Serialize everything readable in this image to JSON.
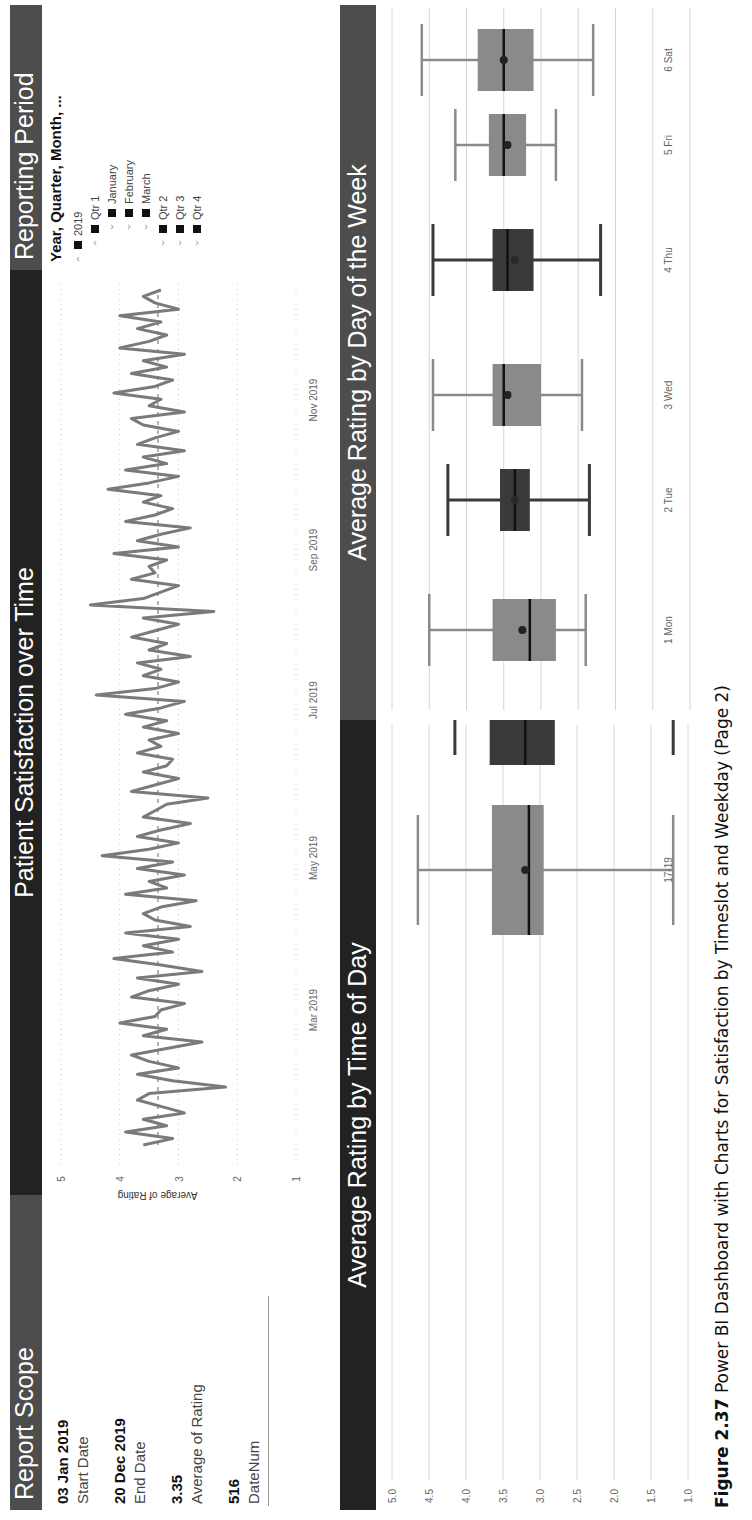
{
  "header_bars": {
    "report_scope": "Report Scope",
    "patient_satisfaction": "Patient Satisfaction over Time",
    "reporting_period": "Reporting Period",
    "time_of_day": "Average Rating by Time of Day",
    "day_of_week": "Average Rating by Day of the Week"
  },
  "report_scope": {
    "cards": [
      {
        "value": "03 Jan 2019",
        "label": "Start Date"
      },
      {
        "value": "20 Dec 2019",
        "label": "End Date"
      },
      {
        "value": "3.35",
        "label": "Average of Rating"
      },
      {
        "value": "516",
        "label": "DateNum"
      }
    ]
  },
  "reporting_period": {
    "title": "Year, Quarter, Month, ...",
    "items": [
      {
        "chevron": "up",
        "checked": true,
        "label": "2019",
        "level": 0
      },
      {
        "chevron": "up",
        "checked": true,
        "label": "Qtr 1",
        "level": 1
      },
      {
        "chevron": "down",
        "checked": true,
        "label": "January",
        "level": 2
      },
      {
        "chevron": "down",
        "checked": true,
        "label": "February",
        "level": 2
      },
      {
        "chevron": "down",
        "checked": true,
        "label": "March",
        "level": 2
      },
      {
        "chevron": "down",
        "checked": true,
        "label": "Qtr 2",
        "level": 1
      },
      {
        "chevron": "down",
        "checked": true,
        "label": "Qtr 3",
        "level": 1
      },
      {
        "chevron": "down",
        "checked": true,
        "label": "Qtr 4",
        "level": 1
      }
    ]
  },
  "caption": {
    "figure": "Figure 2.37",
    "text": "Power BI Dashboard with Charts for Satisfaction by Timeslot and Weekday (Page 2)"
  },
  "colors": {
    "dark_bar": "#222222",
    "mid_bar": "#4d4d4d",
    "line": "#7a7a7a",
    "box_light": "#8a8a8a",
    "box_dark": "#3a3a3a",
    "whisker_light": "#8a8a8a",
    "whisker_dark": "#3a3a3a"
  },
  "chart_data": [
    {
      "type": "line",
      "title": "Patient Satisfaction over Time",
      "xlabel": "",
      "ylabel": "Average of Rating",
      "ylim": [
        1,
        5
      ],
      "yticks": [
        "1",
        "2",
        "3",
        "4",
        "5"
      ],
      "xticks": [
        "Mar 2019",
        "May 2019",
        "Jul 2019",
        "Sep 2019",
        "Nov 2019"
      ],
      "x_range": [
        "03 Jan 2019",
        "20 Dec 2019"
      ],
      "reference_line": {
        "label": "Average",
        "value": 3.35,
        "style": "dashed"
      },
      "grid": true,
      "series": [
        {
          "name": "Average of Rating",
          "values": [
            3.6,
            3.1,
            3.9,
            3.2,
            3.6,
            2.9,
            3.3,
            3.7,
            3.5,
            2.2,
            3.1,
            3.7,
            3.0,
            3.5,
            3.8,
            3.2,
            2.6,
            3.6,
            3.2,
            4.0,
            3.4,
            3.3,
            2.9,
            3.8,
            3.5,
            3.0,
            3.7,
            2.6,
            3.3,
            4.1,
            3.1,
            3.6,
            3.0,
            3.9,
            2.8,
            3.4,
            3.6,
            3.3,
            2.7,
            3.9,
            3.2,
            3.5,
            2.9,
            3.7,
            3.1,
            4.3,
            3.5,
            3.0,
            3.7,
            3.3,
            2.8,
            3.6,
            3.4,
            3.2,
            2.5,
            3.8,
            3.4,
            3.0,
            3.6,
            3.2,
            3.1,
            3.7,
            3.3,
            3.5,
            3.0,
            3.6,
            3.2,
            3.9,
            3.3,
            2.9,
            4.4,
            3.4,
            3.0,
            3.6,
            3.3,
            3.7,
            2.8,
            3.5,
            3.2,
            3.8,
            3.4,
            3.0,
            3.6,
            2.4,
            4.5,
            3.6,
            3.3,
            3.0,
            3.8,
            3.4,
            3.5,
            3.2,
            4.1,
            3.0,
            3.7,
            3.3,
            2.8,
            3.9,
            3.4,
            3.1,
            3.6,
            3.3,
            4.2,
            3.5,
            3.0,
            3.9,
            3.2,
            3.6,
            2.9,
            3.7,
            3.4,
            3.0,
            3.6,
            3.8,
            2.9,
            3.5,
            3.3,
            4.1,
            3.4,
            3.1,
            3.8,
            3.2,
            3.6,
            2.9,
            4.0,
            3.5,
            3.2,
            3.7,
            3.3,
            4.0,
            3.0,
            3.4,
            3.6,
            3.3
          ]
        }
      ]
    },
    {
      "type": "box",
      "title": "Average Rating by Time of Day",
      "categories": [
        "09-11",
        "11-13",
        "13-15",
        "15-17",
        "17-19"
      ],
      "ylim": [
        1.0,
        5.0
      ],
      "yticks": [
        "1.0",
        "1.5",
        "2.0",
        "2.5",
        "3.0",
        "3.5",
        "4.0",
        "4.5",
        "5.0"
      ],
      "grid": true,
      "series": [
        {
          "name": "min",
          "values": [
            2.15,
            2.15,
            2.3,
            1.2,
            1.2
          ]
        },
        {
          "name": "q1",
          "values": [
            2.9,
            2.95,
            3.0,
            2.8,
            2.95
          ]
        },
        {
          "name": "median",
          "values": [
            3.5,
            3.46,
            3.5,
            3.2,
            3.15
          ]
        },
        {
          "name": "mean",
          "values": [
            3.45,
            3.4,
            3.45,
            3.2,
            3.2
          ]
        },
        {
          "name": "q3",
          "values": [
            3.9,
            3.72,
            3.7,
            3.68,
            3.65
          ]
        },
        {
          "name": "max",
          "values": [
            4.5,
            4.6,
            4.55,
            4.15,
            4.65
          ]
        }
      ],
      "shades": [
        "light",
        "dark",
        "light",
        "dark",
        "light"
      ]
    },
    {
      "type": "box",
      "title": "Average Rating by Day of the Week",
      "categories": [
        "1 Mon",
        "2 Tue",
        "3 Wed",
        "4 Thu",
        "5 Fri",
        "6 Sat"
      ],
      "ylim": [
        1.0,
        5.0
      ],
      "yticks": [
        "1.0",
        "1.5",
        "2.0",
        "2.5",
        "3.0",
        "3.5",
        "4.0",
        "4.5",
        "5.0"
      ],
      "grid": true,
      "series": [
        {
          "name": "min",
          "values": [
            2.4,
            2.35,
            2.45,
            2.2,
            2.8,
            2.3
          ]
        },
        {
          "name": "q1",
          "values": [
            2.8,
            3.15,
            3.0,
            3.1,
            3.2,
            3.1
          ]
        },
        {
          "name": "median",
          "values": [
            3.15,
            3.35,
            3.5,
            3.45,
            3.5,
            3.5
          ]
        },
        {
          "name": "mean",
          "values": [
            3.25,
            3.35,
            3.45,
            3.35,
            3.45,
            3.5
          ]
        },
        {
          "name": "q3",
          "values": [
            3.65,
            3.55,
            3.65,
            3.65,
            3.7,
            3.85
          ]
        },
        {
          "name": "max",
          "values": [
            4.5,
            4.25,
            4.45,
            4.45,
            4.15,
            4.6
          ]
        }
      ],
      "shades": [
        "light",
        "dark",
        "light",
        "dark",
        "light",
        "light"
      ]
    }
  ]
}
